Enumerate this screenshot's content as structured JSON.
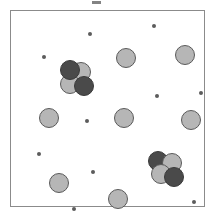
{
  "figure": {
    "title": "",
    "background_color": "#ffffff",
    "frame": {
      "border_color": "#8b8b8b",
      "fill_color": "#ffffff",
      "x": 10,
      "y": 10,
      "width": 195,
      "height": 197
    },
    "top_mark": {
      "label": "top-edge-dash",
      "color": "#6d6d6d",
      "x": 92,
      "y": 1,
      "width": 9,
      "height": 3
    }
  },
  "legend": {
    "species": [
      {
        "id": "light",
        "label": "light-gray-particle",
        "color": "#b6b6b6",
        "stroke": "#5a5a5a",
        "radius": 10
      },
      {
        "id": "dark",
        "label": "dark-gray-particle",
        "color": "#4a4a4a",
        "stroke": "#3a3a3a",
        "radius": 10
      },
      {
        "id": "speck",
        "label": "small-speck",
        "color": "#5c5c5c",
        "stroke": "#5c5c5c",
        "radius": 2
      }
    ]
  },
  "chart_data": {
    "type": "scatter",
    "title": "",
    "xlabel": "",
    "ylabel": "",
    "xlim": [
      0,
      195
    ],
    "ylim": [
      0,
      197
    ],
    "grid": false,
    "legend_position": "none",
    "counts": {
      "large_light": 9,
      "large_dark": 4,
      "small_specks": 10,
      "clusters": 2,
      "total_particles": 23
    },
    "series": [
      {
        "name": "large-light-particles",
        "species": "light",
        "radius": 10,
        "color": "#b6b6b6",
        "points": [
          {
            "id": "light-1",
            "x": 115,
            "y": 47
          },
          {
            "id": "light-2",
            "x": 174,
            "y": 44
          },
          {
            "id": "light-3",
            "x": 38,
            "y": 107
          },
          {
            "id": "light-4",
            "x": 113,
            "y": 107
          },
          {
            "id": "light-5",
            "x": 180,
            "y": 109
          },
          {
            "id": "light-6",
            "x": 48,
            "y": 172
          },
          {
            "id": "light-7",
            "x": 107,
            "y": 188
          },
          {
            "id": "light-8",
            "x": 70,
            "y": 61,
            "cluster": "upper-left"
          },
          {
            "id": "light-9",
            "x": 59,
            "y": 73,
            "cluster": "upper-left"
          }
        ]
      },
      {
        "name": "cluster-upper-left-dark",
        "species": "dark",
        "radius": 10,
        "color": "#4a4a4a",
        "points": [
          {
            "id": "dark-1",
            "x": 59,
            "y": 59,
            "cluster": "upper-left"
          },
          {
            "id": "dark-2",
            "x": 73,
            "y": 75,
            "cluster": "upper-left"
          }
        ]
      },
      {
        "name": "cluster-lower-right",
        "species": "mixed",
        "radius": 10,
        "points": [
          {
            "id": "dark-3",
            "x": 147,
            "y": 150,
            "species": "dark",
            "cluster": "lower-right"
          },
          {
            "id": "light-10",
            "x": 161,
            "y": 152,
            "species": "light",
            "cluster": "lower-right"
          },
          {
            "id": "light-11",
            "x": 150,
            "y": 163,
            "species": "light",
            "cluster": "lower-right"
          },
          {
            "id": "dark-4",
            "x": 163,
            "y": 166,
            "species": "dark",
            "cluster": "lower-right"
          }
        ]
      },
      {
        "name": "small-specks",
        "species": "speck",
        "radius": 2,
        "color": "#5c5c5c",
        "points": [
          {
            "id": "speck-1",
            "x": 79,
            "y": 23
          },
          {
            "id": "speck-2",
            "x": 143,
            "y": 15
          },
          {
            "id": "speck-3",
            "x": 33,
            "y": 46
          },
          {
            "id": "speck-4",
            "x": 146,
            "y": 85
          },
          {
            "id": "speck-5",
            "x": 190,
            "y": 82
          },
          {
            "id": "speck-6",
            "x": 76,
            "y": 110
          },
          {
            "id": "speck-7",
            "x": 28,
            "y": 143
          },
          {
            "id": "speck-8",
            "x": 82,
            "y": 161
          },
          {
            "id": "speck-9",
            "x": 63,
            "y": 198
          },
          {
            "id": "speck-10",
            "x": 183,
            "y": 191
          }
        ]
      }
    ]
  }
}
